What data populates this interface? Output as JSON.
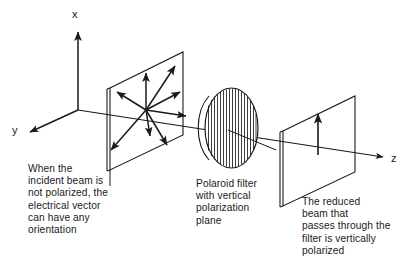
{
  "figure": {
    "stroke_color": "#1a1a1a",
    "background_color": "#ffffff"
  },
  "axes": {
    "x_label": "x",
    "y_label": "y",
    "z_label": "z"
  },
  "captions": {
    "incident": "When the\nincident beam is\nnot polarized, the\nelectrical vector\ncan have any\norientation",
    "filter": "Polaroid filter\nwith vertical\npolarization\nplane",
    "reduced": "The reduced\nbeam that\npasses through the\nfilter is vertically\npolarized"
  },
  "elements": {
    "incident_plane_name": "incident-beam-plane",
    "filter_name": "polaroid-filter-ellipse",
    "reduced_plane_name": "reduced-beam-plane",
    "unpolarized_arrow_count": 8,
    "polarized_arrow_count": 1,
    "filter_hatch_line_count": 16
  }
}
